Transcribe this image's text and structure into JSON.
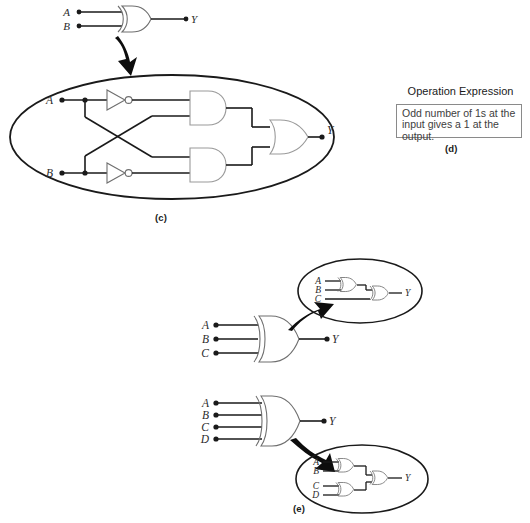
{
  "figure": {
    "panels": [
      "c",
      "d",
      "e"
    ]
  },
  "panel_c": {
    "label": "(c)",
    "top_gate": {
      "type": "xor-gate",
      "inputs": [
        "A",
        "B"
      ],
      "output": "Y"
    },
    "expansion": {
      "description": "XOR expanded into inverters, AND gates and an OR gate",
      "inputs": [
        "A",
        "B"
      ],
      "output": "Y",
      "gates": [
        "not-gate",
        "not-gate",
        "and-gate",
        "and-gate",
        "or-gate"
      ]
    }
  },
  "panel_d": {
    "label": "(d)",
    "heading": "Operation Expression",
    "expression": "Odd number of 1s at the input gives a 1 at the output."
  },
  "panel_e": {
    "label": "(e)",
    "three_input": {
      "gate": {
        "type": "xor-gate",
        "inputs": [
          "A",
          "B",
          "C"
        ],
        "output": "Y"
      },
      "expansion": {
        "description": "Three-input XOR built from two cascaded two-input XOR gates",
        "inputs": [
          "A",
          "B",
          "C"
        ],
        "output": "Y",
        "gate_count": 2
      }
    },
    "four_input": {
      "gate": {
        "type": "xor-gate",
        "inputs": [
          "A",
          "B",
          "C",
          "D"
        ],
        "output": "Y"
      },
      "expansion": {
        "description": "Four-input XOR built from three two-input XOR gates in a tree",
        "inputs": [
          "A",
          "B",
          "C",
          "D"
        ],
        "output": "Y",
        "gate_count": 3
      }
    }
  },
  "colors": {
    "wire": "#1a1a1a",
    "gate_outline": "#8a8a8a",
    "ellipse": "#1a1a1a",
    "text": "#2b2b2b",
    "box_border": "#8a8a8a"
  }
}
